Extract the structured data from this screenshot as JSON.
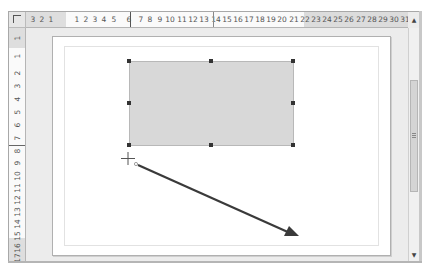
{
  "horizontal_ruler": {
    "labels": [
      {
        "text": "3",
        "x": 7
      },
      {
        "text": "2",
        "x": 16
      },
      {
        "text": "1",
        "x": 25
      },
      {
        "text": "1",
        "x": 51
      },
      {
        "text": "2",
        "x": 60
      },
      {
        "text": "3",
        "x": 69
      },
      {
        "text": "4",
        "x": 78
      },
      {
        "text": "5",
        "x": 88
      },
      {
        "text": "6",
        "x": 103
      },
      {
        "text": "7",
        "x": 115
      },
      {
        "text": "8",
        "x": 124
      },
      {
        "text": "9",
        "x": 134
      },
      {
        "text": "10",
        "x": 144
      },
      {
        "text": "11",
        "x": 156
      },
      {
        "text": "12",
        "x": 167
      },
      {
        "text": "13",
        "x": 178
      },
      {
        "text": "14",
        "x": 190
      },
      {
        "text": "15",
        "x": 201
      },
      {
        "text": "16",
        "x": 212
      },
      {
        "text": "17",
        "x": 223
      },
      {
        "text": "18",
        "x": 234
      },
      {
        "text": "19",
        "x": 245
      },
      {
        "text": "20",
        "x": 256
      },
      {
        "text": "21",
        "x": 268
      },
      {
        "text": "22",
        "x": 279
      },
      {
        "text": "23",
        "x": 290
      },
      {
        "text": "24",
        "x": 301
      },
      {
        "text": "25",
        "x": 312
      },
      {
        "text": "26",
        "x": 323
      },
      {
        "text": "27",
        "x": 335
      },
      {
        "text": "28",
        "x": 346
      },
      {
        "text": "29",
        "x": 357
      },
      {
        "text": "30",
        "x": 368
      },
      {
        "text": "31",
        "x": 379
      }
    ]
  },
  "vertical_ruler": {
    "labels": [
      {
        "text": "1",
        "y": 10
      },
      {
        "text": "1",
        "y": 28
      },
      {
        "text": "2",
        "y": 45
      },
      {
        "text": "3",
        "y": 58
      },
      {
        "text": "4",
        "y": 71
      },
      {
        "text": "5",
        "y": 84
      },
      {
        "text": "6",
        "y": 97
      },
      {
        "text": "7",
        "y": 110
      },
      {
        "text": "8",
        "y": 123
      },
      {
        "text": "9",
        "y": 135
      },
      {
        "text": "10",
        "y": 148
      },
      {
        "text": "11",
        "y": 160
      },
      {
        "text": "12",
        "y": 172
      },
      {
        "text": "13",
        "y": 184
      },
      {
        "text": "14",
        "y": 196
      },
      {
        "text": "15",
        "y": 208
      },
      {
        "text": "16",
        "y": 220
      },
      {
        "text": "17",
        "y": 230
      },
      {
        "text": "18",
        "y": 240
      },
      {
        "text": "19",
        "y": 248
      },
      {
        "text": "20",
        "y": 257
      }
    ]
  },
  "scrollbar": {
    "up_arrow": "▲",
    "down_arrow": "▼"
  },
  "drawing": {
    "rectangle": {
      "fill": "#d8d8d8",
      "border": "#b8b8b8"
    },
    "arrow": {
      "color": "#3a3a3a",
      "x1": 138,
      "y1": 165,
      "x2": 298,
      "y2": 236
    },
    "cursor": "crosshair"
  }
}
